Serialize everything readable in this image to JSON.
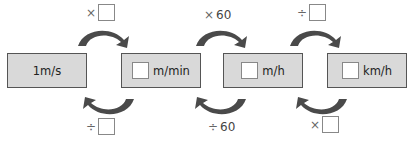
{
  "boxes": [
    {
      "unit": "1m/s",
      "has_blank": false
    },
    {
      "unit": "m/min",
      "has_blank": true
    },
    {
      "unit": "m/h",
      "has_blank": true
    },
    {
      "unit": "km/h",
      "has_blank": true
    }
  ],
  "forward_ops": [
    {
      "symbol": "×",
      "value": "",
      "has_blank": true
    },
    {
      "symbol": "×",
      "value": "60",
      "has_blank": false
    },
    {
      "symbol": "÷",
      "value": "",
      "has_blank": true
    }
  ],
  "backward_ops": [
    {
      "symbol": "÷",
      "value": "",
      "has_blank": true
    },
    {
      "symbol": "÷",
      "value": "60",
      "has_blank": false
    },
    {
      "symbol": "×",
      "value": "",
      "has_blank": true
    }
  ],
  "colors": {
    "box_fill": "#d9d9d9",
    "arrow": "#4a4a4a",
    "border": "#555555"
  }
}
